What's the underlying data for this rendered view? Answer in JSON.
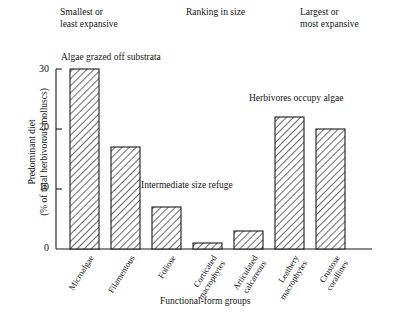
{
  "chart_data": {
    "type": "bar",
    "title": "",
    "xlabel": "Functional-form groups",
    "ylabel": "Predominant diet\n(% of total herbivorous molluscs)",
    "ylim": [
      0,
      30
    ],
    "yticks": [
      0,
      10,
      20,
      30
    ],
    "grid": false,
    "legend": null,
    "categories": [
      "Microalgae",
      "Filamentous",
      "Foliose",
      "Corticated\nmacrophytes",
      "Articulated\ncalcareous",
      "Leathery\nmacrophytes",
      "Crustose\ncorallines"
    ],
    "values": [
      30,
      17,
      7,
      1,
      3,
      22,
      20
    ],
    "annotations": [
      "Algae grazed off substrata",
      "Intermediate size refuge",
      "Herbivores occupy algae"
    ],
    "headers": [
      "Smallest or\nleast expansive",
      "Ranking in size",
      "Largest or\nmost expansive"
    ],
    "bar_fill": "#ffffff",
    "bar_edge": "#1a1a1a",
    "hatch": "diagonal"
  },
  "headers": {
    "smallest": "Smallest or\nleast expansive",
    "ranking": "Ranking in size",
    "largest": "Largest or\nmost expansive"
  },
  "annotations": {
    "algae": "Algae grazed off substrata",
    "intermediate": "Intermediate size refuge",
    "herbivores": "Herbivores occupy algae"
  },
  "axes": {
    "ylabel": "Predominant diet\n(% of total herbivorous molluscs)",
    "xlabel": "Functional-form groups",
    "ytick_0": "0",
    "ytick_10": "10",
    "ytick_20": "20",
    "ytick_30": "30"
  }
}
